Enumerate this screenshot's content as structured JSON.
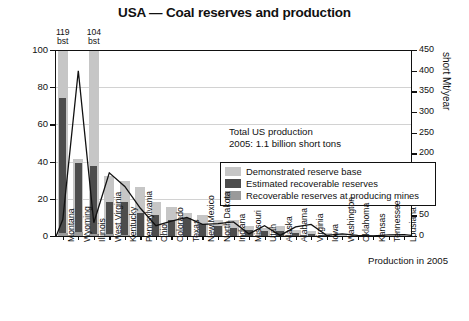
{
  "header": {
    "title": "USA — Coal reserves and production"
  },
  "annotations": {
    "total_line1": "Total US production",
    "total_line2": "2005: 1.1 billion short tons",
    "production_label": "Production in 2005",
    "capped": [
      {
        "value": "119",
        "unit": "bst",
        "state": "Montana"
      },
      {
        "value": "104",
        "unit": "bst",
        "state": "Illinois"
      }
    ]
  },
  "legend": {
    "items": [
      {
        "label": "Demonstrated reserve base",
        "color": "#c6c6c6",
        "icon": "legend-swatch-icon"
      },
      {
        "label": "Estimated recoverable reserves",
        "color": "#4d4d4d",
        "icon": "legend-swatch-icon"
      },
      {
        "label": "Recoverable reserves at producing mines",
        "color": "#9a9a9a",
        "icon": "legend-swatch-icon"
      }
    ]
  },
  "chart_data": {
    "type": "bar",
    "title": "USA — Coal reserves and production",
    "xlabel": "",
    "ylabel": "billion short t",
    "y2label": "short Mt/year",
    "ylim": [
      0,
      100
    ],
    "y2lim": [
      0,
      450
    ],
    "yticks": [
      0,
      20,
      40,
      60,
      80,
      100
    ],
    "y2ticks": [
      0,
      50,
      100,
      150,
      200,
      250,
      300,
      350,
      400,
      450
    ],
    "grid": true,
    "legend_position": "inside-upper-center",
    "categories": [
      "Montana",
      "Wyoming",
      "Illinois",
      "West Virginia",
      "Kentucky",
      "Pennsylvania",
      "Ohio",
      "Colorado",
      "Texas",
      "New Mexico",
      "North Dakota",
      "Indiana",
      "Missouri",
      "Utah",
      "Alaska",
      "Alabama",
      "Virginia",
      "Iowa",
      "Washington",
      "Oklahoma",
      "Kansas",
      "Tennessee",
      "Lousiana"
    ],
    "series": [
      {
        "name": "Demonstrated reserve base",
        "unit": "billion short t",
        "color": "#c6c6c6",
        "values": [
          119,
          42,
          104,
          33,
          30,
          27,
          19,
          16,
          13,
          12,
          9,
          9,
          6,
          5,
          6,
          4,
          3,
          2,
          1.5,
          1,
          1,
          0.6,
          0.4
        ],
        "note": "Montana and Illinois bars are clipped at the 100 axis maximum"
      },
      {
        "name": "Estimated recoverable reserves",
        "unit": "billion short t",
        "color": "#4d4d4d",
        "values": [
          75,
          40,
          38,
          19,
          19,
          13,
          12,
          9,
          10,
          7,
          6,
          5,
          4,
          3,
          3,
          2,
          1.5,
          1.2,
          0.8,
          0.6,
          0.5,
          0.3,
          0.2
        ]
      },
      {
        "name": "Recoverable reserves at producing mines",
        "unit": "billion short t",
        "color": "#9a9a9a",
        "values": [
          2,
          2.5,
          1.5,
          1.5,
          1.2,
          0.8,
          0.7,
          0.7,
          0.6,
          0.5,
          0.5,
          0.4,
          0.3,
          0.3,
          0.3,
          0.2,
          0.2,
          0.2,
          0.1,
          0.1,
          0.1,
          0.05,
          0.05
        ]
      },
      {
        "name": "Production in 2005",
        "unit": "short Mt/year",
        "type": "line",
        "color": "#111111",
        "axis": "right",
        "values": [
          40,
          400,
          32,
          153,
          120,
          67,
          25,
          36,
          45,
          28,
          30,
          34,
          5,
          25,
          1.5,
          22,
          28,
          1.5,
          5,
          1.8,
          0.3,
          2.8,
          3.5
        ]
      }
    ]
  }
}
